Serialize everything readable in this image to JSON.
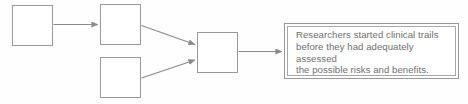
{
  "diagram": {
    "type": "flowchart",
    "background_color": "#fefefe",
    "box_border_color": "#9a9a9a",
    "arrow_color": "#8a8a8a",
    "text_color": "#6f6f6f",
    "nodes": [
      {
        "id": "node-1",
        "label": "",
        "x": 12,
        "y": 5,
        "w": 41,
        "h": 41
      },
      {
        "id": "node-2",
        "label": "",
        "x": 100,
        "y": 4,
        "w": 41,
        "h": 41
      },
      {
        "id": "node-3",
        "label": "",
        "x": 100,
        "y": 57,
        "w": 41,
        "h": 41
      },
      {
        "id": "node-4",
        "label": "",
        "x": 197,
        "y": 32,
        "w": 41,
        "h": 41
      }
    ],
    "connectors": [
      {
        "id": "arrow-1",
        "from": "node-1",
        "to": "node-2",
        "style": "straight-horizontal"
      },
      {
        "id": "arrow-2",
        "from": "node-2",
        "to": "node-4",
        "style": "diagonal-down"
      },
      {
        "id": "arrow-3",
        "from": "node-3",
        "to": "node-4",
        "style": "diagonal-up"
      },
      {
        "id": "arrow-4",
        "from": "node-4",
        "to": "callout",
        "style": "straight-horizontal"
      }
    ],
    "callout": {
      "id": "callout",
      "border_style": "double",
      "lines": [
        "Researchers started clinical trails",
        "before they had adequately assessed",
        "the possible risks and benefits."
      ],
      "text": "Researchers started clinical trails\nbefore they had adequately assessed\nthe possible risks and benefits."
    }
  }
}
